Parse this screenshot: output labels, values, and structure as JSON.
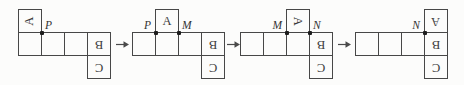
{
  "figure": {
    "background": "#fcfcfb",
    "line_color": "#474747",
    "text_color": "#3a3a3a"
  },
  "arrows": {
    "count": 3,
    "direction": "right"
  },
  "shapes": [
    {
      "a_letter": "A",
      "b_letter": "B",
      "c_letter": "C",
      "a_col": 0,
      "a_rotation_deg": -90,
      "b_rotation_deg": 180,
      "c_rotation_deg": 180,
      "points": [
        {
          "label": "P",
          "corner": 1,
          "side": "right"
        }
      ]
    },
    {
      "a_letter": "A",
      "b_letter": "B",
      "c_letter": "C",
      "a_col": 1,
      "a_rotation_deg": 0,
      "b_rotation_deg": 180,
      "c_rotation_deg": 180,
      "points": [
        {
          "label": "P",
          "corner": 1,
          "side": "left"
        },
        {
          "label": "M",
          "corner": 2,
          "side": "right"
        }
      ]
    },
    {
      "a_letter": "A",
      "b_letter": "B",
      "c_letter": "C",
      "a_col": 2,
      "a_rotation_deg": 90,
      "b_rotation_deg": 180,
      "c_rotation_deg": 180,
      "points": [
        {
          "label": "M",
          "corner": 2,
          "side": "left"
        },
        {
          "label": "N",
          "corner": 3,
          "side": "right"
        }
      ]
    },
    {
      "a_letter": "A",
      "b_letter": "B",
      "c_letter": "C",
      "a_col": 3,
      "a_rotation_deg": 180,
      "b_rotation_deg": 180,
      "c_rotation_deg": 180,
      "points": [
        {
          "label": "N",
          "corner": 3,
          "side": "left"
        }
      ]
    }
  ]
}
